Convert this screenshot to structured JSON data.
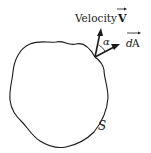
{
  "diagram": {
    "surface_label": "S",
    "velocity_label": "Velocity",
    "velocity_symbol": "V",
    "area_symbol_d": "d",
    "area_symbol_A": "A",
    "angle_label": "α",
    "colors": {
      "line": "#1a1a1a",
      "background": "#ffffff"
    }
  }
}
